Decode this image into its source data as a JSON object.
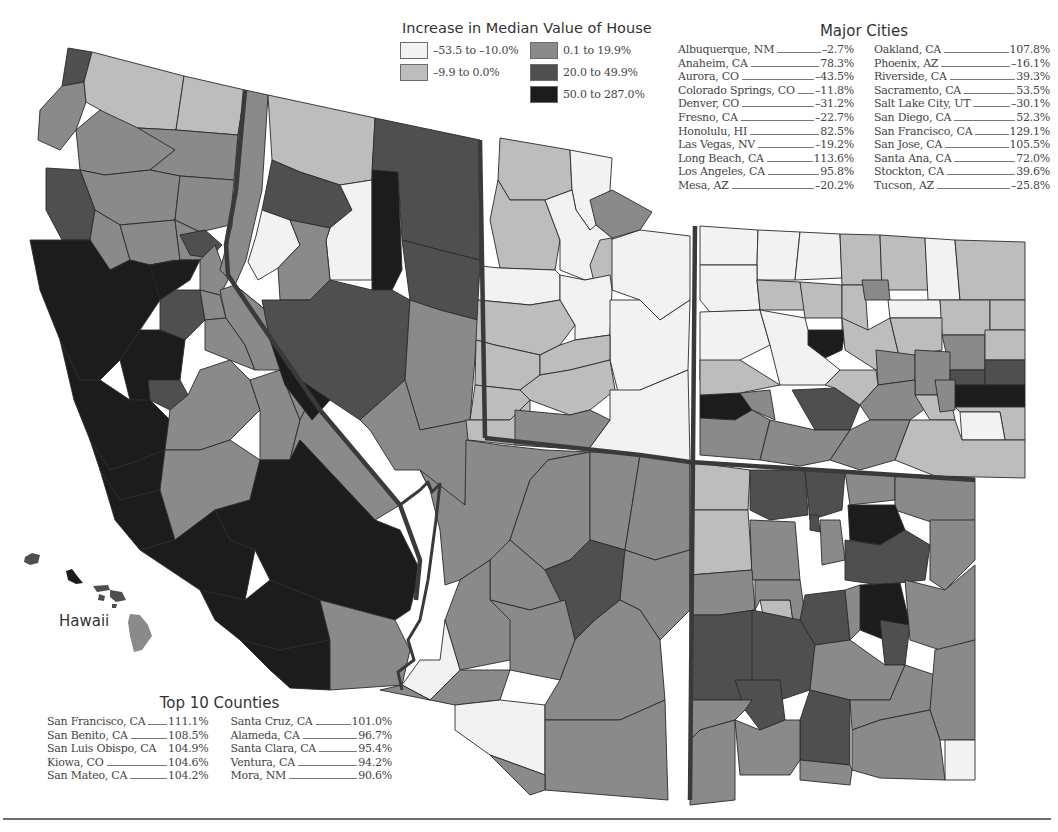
{
  "legend": {
    "title": "Increase in Median Value of House",
    "items": [
      {
        "label": "–53.5 to –10.0%",
        "color": "#f2f2f2"
      },
      {
        "label": "0.1 to 19.9%",
        "color": "#8a8a8a"
      },
      {
        "label": "–9.9 to 0.0%",
        "color": "#bdbdbd"
      },
      {
        "label": "20.0 to 49.9%",
        "color": "#4f4f4f"
      },
      {
        "label": "",
        "color": ""
      },
      {
        "label": "50.0 to 287.0%",
        "color": "#1c1c1c"
      }
    ]
  },
  "major_cities": {
    "title": "Major Cities",
    "left": [
      {
        "name": "Albuquerque, NM",
        "value": "–2.7%"
      },
      {
        "name": "Anaheim, CA",
        "value": "78.3%"
      },
      {
        "name": "Aurora, CO",
        "value": "–43.5%"
      },
      {
        "name": "Colorado Springs, CO",
        "value": "–11.8%"
      },
      {
        "name": "Denver, CO",
        "value": "–31.2%"
      },
      {
        "name": "Fresno, CA",
        "value": "–22.7%"
      },
      {
        "name": "Honolulu, HI",
        "value": "82.5%"
      },
      {
        "name": "Las Vegas, NV",
        "value": "–19.2%"
      },
      {
        "name": "Long Beach, CA",
        "value": "113.6%"
      },
      {
        "name": "Los Angeles, CA",
        "value": "95.8%"
      },
      {
        "name": "Mesa, AZ",
        "value": "–20.2%"
      }
    ],
    "right": [
      {
        "name": "Oakland, CA",
        "value": "107.8%"
      },
      {
        "name": "Phoenix, AZ",
        "value": "–16.1%"
      },
      {
        "name": "Riverside, CA",
        "value": "39.3%"
      },
      {
        "name": "Sacramento, CA",
        "value": "53.5%"
      },
      {
        "name": "Salt Lake City, UT",
        "value": "–30.1%"
      },
      {
        "name": "San Diego, CA",
        "value": "52.3%"
      },
      {
        "name": "San Francisco, CA",
        "value": "129.1%"
      },
      {
        "name": "San Jose, CA",
        "value": "105.5%"
      },
      {
        "name": "Santa Ana, CA",
        "value": "72.0%"
      },
      {
        "name": "Stockton, CA",
        "value": "39.6%"
      },
      {
        "name": "Tucson, AZ",
        "value": "–25.8%"
      }
    ]
  },
  "top_counties": {
    "title": "Top 10 Counties",
    "left": [
      {
        "name": "San Francisco, CA",
        "value": "111.1%"
      },
      {
        "name": "San Benito, CA",
        "value": "108.5%"
      },
      {
        "name": "San Luis Obispo, CA",
        "value": "104.9%"
      },
      {
        "name": "Kiowa, CO",
        "value": "104.6%"
      },
      {
        "name": "San Mateo, CA",
        "value": "104.2%"
      }
    ],
    "right": [
      {
        "name": "Santa Cruz, CA",
        "value": "101.0%"
      },
      {
        "name": "Alameda, CA",
        "value": "96.7%"
      },
      {
        "name": "Santa Clara, CA",
        "value": "95.4%"
      },
      {
        "name": "Ventura, CA",
        "value": "94.2%"
      },
      {
        "name": "Mora, NM",
        "value": "90.6%"
      }
    ]
  },
  "map": {
    "inset_label": "Hawaii",
    "states": [
      "California",
      "Nevada",
      "Utah",
      "Colorado",
      "Arizona",
      "New Mexico",
      "Hawaii"
    ]
  }
}
